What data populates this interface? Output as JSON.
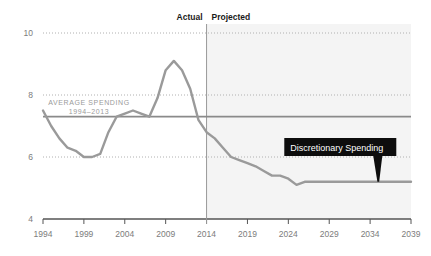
{
  "chart_data": {
    "type": "line",
    "title": "",
    "subtitle": "",
    "xlabel": "",
    "ylabel": "",
    "xlim": [
      1994,
      2039
    ],
    "ylim": [
      4,
      10
    ],
    "grid": true,
    "gridlines_y": [
      6,
      8,
      10
    ],
    "y_ticks": [
      "10",
      "8",
      "6",
      "4"
    ],
    "y_tick_values": [
      10,
      8,
      6,
      4
    ],
    "x_ticks": [
      "1994",
      "1999",
      "2004",
      "2009",
      "2014",
      "2019",
      "2024",
      "2029",
      "2034",
      "2039"
    ],
    "x_tick_values": [
      1994,
      1999,
      2004,
      2009,
      2014,
      2019,
      2024,
      2029,
      2034,
      2039
    ],
    "divider_year": 2014,
    "phase_labels": {
      "actual": "Actual",
      "projected": "Projected"
    },
    "series": [
      {
        "name": "Discretionary Spending",
        "color": "#9a9a9a",
        "x": [
          1994,
          1995,
          1996,
          1997,
          1998,
          1999,
          2000,
          2001,
          2002,
          2003,
          2004,
          2005,
          2006,
          2007,
          2008,
          2009,
          2010,
          2011,
          2012,
          2013,
          2014,
          2015,
          2016,
          2017,
          2018,
          2019,
          2020,
          2021,
          2022,
          2023,
          2024,
          2025,
          2026,
          2027,
          2028,
          2029,
          2030,
          2031,
          2032,
          2033,
          2034,
          2035,
          2036,
          2037,
          2038,
          2039
        ],
        "y": [
          7.5,
          7.0,
          6.6,
          6.3,
          6.2,
          6.0,
          6.0,
          6.1,
          6.8,
          7.3,
          7.4,
          7.5,
          7.4,
          7.3,
          7.9,
          8.8,
          9.1,
          8.8,
          8.2,
          7.2,
          6.8,
          6.6,
          6.3,
          6.0,
          5.9,
          5.8,
          5.7,
          5.55,
          5.4,
          5.4,
          5.3,
          5.1,
          5.2,
          5.2,
          5.2,
          5.2,
          5.2,
          5.2,
          5.2,
          5.2,
          5.2,
          5.2,
          5.2,
          5.2,
          5.2,
          5.2
        ]
      }
    ],
    "reference_line": {
      "name": "Average Spending 1994-2013",
      "value": 7.3,
      "color": "#8a8a8a",
      "label_line1": "AVERAGE SPENDING",
      "label_line2": "1994–2013"
    },
    "annotations": [
      {
        "name": "discretionary-spending-callout",
        "text": "Discretionary Spending",
        "year": 2035,
        "value": 5.2,
        "background": "#0d0d0d",
        "text_color": "#ffffff"
      }
    ],
    "colors": {
      "background": "#ffffff",
      "projected_shade": "#f4f4f4",
      "grid": "#b0b0b0",
      "axis": "#555555",
      "divider": "#9a9a9a",
      "line": "#9a9a9a",
      "reference_line": "#8a8a8a",
      "tick_text": "#7c7c7c",
      "phase_text": "#1a1a1a",
      "callout_bg": "#0d0d0d"
    }
  }
}
